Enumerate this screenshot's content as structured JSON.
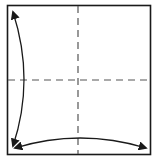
{
  "diagram": {
    "type": "origami-fold-diagram",
    "colors": {
      "background": "#ffffff",
      "paper_border": "#1a1a1a",
      "fold_line": "#555555",
      "arrow": "#1a1a1a"
    },
    "square": {
      "x": 7,
      "y": 5,
      "width": 144,
      "height": 150
    },
    "fold_lines": [
      {
        "id": "vertical-center",
        "style": "dashed",
        "x1": 78,
        "y1": 5,
        "x2": 78,
        "y2": 155
      },
      {
        "id": "horizontal-center",
        "style": "dashed",
        "x1": 7,
        "y1": 80,
        "x2": 151,
        "y2": 80
      }
    ],
    "arrows": [
      {
        "id": "left-arc",
        "heads": "both",
        "from": [
          13,
          12
        ],
        "to": [
          13,
          146
        ],
        "bulge": "right"
      },
      {
        "id": "bottom-arc",
        "heads": "both",
        "from": [
          15,
          148
        ],
        "to": [
          146,
          148
        ],
        "bulge": "up"
      }
    ]
  }
}
